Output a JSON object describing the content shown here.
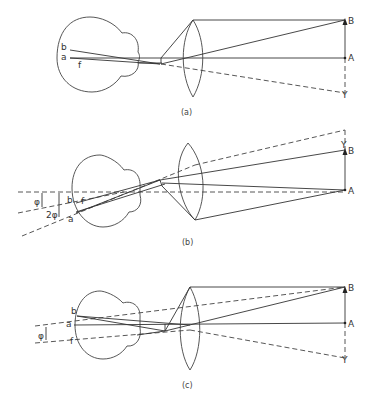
{
  "figure": {
    "panels": [
      {
        "caption": "(a)",
        "labels": {
          "B": "B",
          "A": "A",
          "Y": "Y",
          "b": "b",
          "a": "a",
          "f": "f"
        }
      },
      {
        "caption": "(b)",
        "labels": {
          "B": "B",
          "A": "A",
          "Y": "Y",
          "b": "b",
          "a": "a",
          "f": "f",
          "phi": "φ",
          "two_phi": "2φ"
        }
      },
      {
        "caption": "(c)",
        "labels": {
          "B": "B",
          "A": "A",
          "Y": "Y",
          "b": "b",
          "a": "a",
          "f": "f",
          "phi": "φ"
        }
      }
    ],
    "colors": {
      "line": "#333333",
      "background": "#ffffff"
    }
  }
}
